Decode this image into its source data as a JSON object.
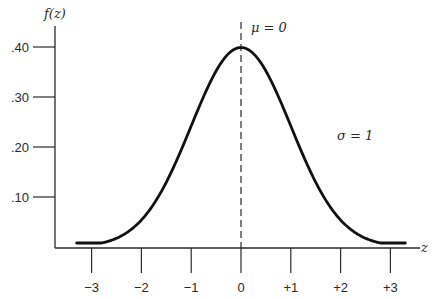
{
  "chart_data": {
    "type": "line",
    "xlabel": "z",
    "ylabel": "f(z)",
    "xlim": [
      -3.3,
      3.3
    ],
    "ylim": [
      0,
      0.4
    ],
    "grid": false,
    "legend": "none",
    "x_ticks": [
      "−3",
      "−2",
      "−1",
      "0",
      "+1",
      "+2",
      "+3"
    ],
    "x_tick_values": [
      -3,
      -2,
      -1,
      0,
      1,
      2,
      3
    ],
    "y_ticks": [
      ".10",
      ".20",
      ".30",
      ".40"
    ],
    "y_tick_values": [
      0.1,
      0.2,
      0.3,
      0.4
    ],
    "series": [
      {
        "name": "f(z)",
        "mean": 0,
        "sd": 1,
        "x": [
          -3.3,
          -3,
          -2.5,
          -2,
          -1.5,
          -1,
          -0.5,
          0,
          0.5,
          1,
          1.5,
          2,
          2.5,
          3,
          3.3
        ],
        "values": [
          0.002,
          0.004,
          0.018,
          0.054,
          0.13,
          0.242,
          0.352,
          0.399,
          0.352,
          0.242,
          0.13,
          0.054,
          0.018,
          0.004,
          0.002
        ]
      }
    ],
    "annotations": [
      {
        "text": "μ = 0",
        "at": "dashed vertical line at z = 0"
      },
      {
        "text": "σ = 1",
        "at": "right of curve"
      }
    ]
  },
  "labels": {
    "y_axis": "f(z)",
    "x_axis": "z",
    "mu": "μ = 0",
    "sigma": "σ = 1"
  }
}
